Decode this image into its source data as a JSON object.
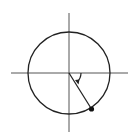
{
  "diagram": {
    "type": "unit-circle",
    "center": [
      69,
      73
    ],
    "radius": 41,
    "angle_direction": "clockwise",
    "angle_degrees_from_positive_x": -60,
    "point_marker": "filled-dot",
    "colors": {
      "stroke": "#222222",
      "axis": "#555555",
      "background": "#ffffff"
    }
  }
}
